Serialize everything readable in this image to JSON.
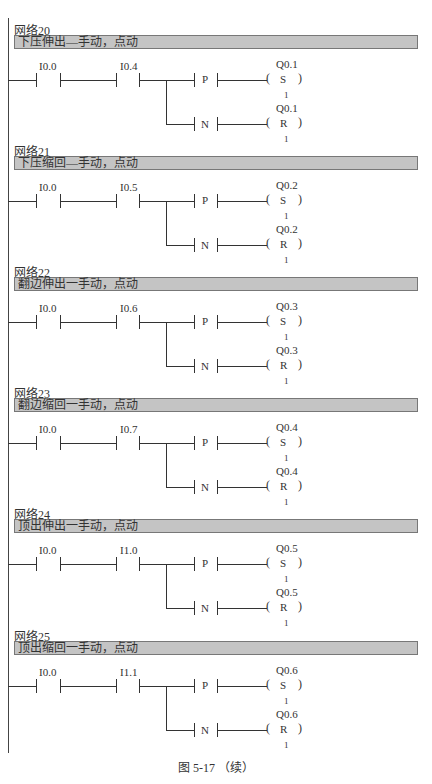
{
  "figure_caption": "图 5-17 （续）",
  "networks": [
    {
      "title": "网络20",
      "comment": "下压伸出—手动，点动",
      "contact1": "I0.0",
      "contact2": "I0.4",
      "coil_set": "Q0.1",
      "coil_reset": "Q0.1",
      "set_letter": "S",
      "reset_letter": "R",
      "pos_edge": "P",
      "neg_edge": "N",
      "count": "1"
    },
    {
      "title": "网络21",
      "comment": "下压缩回—手动，点动",
      "contact1": "I0.0",
      "contact2": "I0.5",
      "coil_set": "Q0.2",
      "coil_reset": "Q0.2",
      "set_letter": "S",
      "reset_letter": "R",
      "pos_edge": "P",
      "neg_edge": "N",
      "count": "1"
    },
    {
      "title": "网络22",
      "comment": "翻边伸出一手动，点动",
      "contact1": "I0.0",
      "contact2": "I0.6",
      "coil_set": "Q0.3",
      "coil_reset": "Q0.3",
      "set_letter": "S",
      "reset_letter": "R",
      "pos_edge": "P",
      "neg_edge": "N",
      "count": "1"
    },
    {
      "title": "网络23",
      "comment": "翻边缩回一手动，点动",
      "contact1": "I0.0",
      "contact2": "I0.7",
      "coil_set": "Q0.4",
      "coil_reset": "Q0.4",
      "set_letter": "S",
      "reset_letter": "R",
      "pos_edge": "P",
      "neg_edge": "N",
      "count": "1"
    },
    {
      "title": "网络24",
      "comment": "顶出伸出一手动，点动",
      "contact1": "I0.0",
      "contact2": "I1.0",
      "coil_set": "Q0.5",
      "coil_reset": "Q0.5",
      "set_letter": "S",
      "reset_letter": "R",
      "pos_edge": "P",
      "neg_edge": "N",
      "count": "1"
    },
    {
      "title": "网络25",
      "comment": "顶出缩回一手动，点动",
      "contact1": "I0.0",
      "contact2": "I1.1",
      "coil_set": "Q0.6",
      "coil_reset": "Q0.6",
      "set_letter": "S",
      "reset_letter": "R",
      "pos_edge": "P",
      "neg_edge": "N",
      "count": "1"
    }
  ]
}
